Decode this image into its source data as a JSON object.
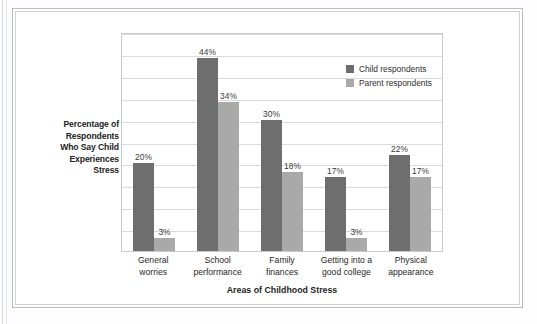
{
  "chart_data": {
    "type": "bar",
    "title": "",
    "xlabel": "Areas of Childhood Stress",
    "ylabel": "Percentage of Respondents Who Say Child Experiences Stress",
    "categories": [
      "General worries",
      "School performance",
      "Family finances",
      "Getting into a good college",
      "Physical appearance"
    ],
    "category_lines": [
      [
        "General",
        "worries"
      ],
      [
        "School",
        "performance"
      ],
      [
        "Family",
        "finances"
      ],
      [
        "Getting into a",
        "good college"
      ],
      [
        "Physical",
        "appearance"
      ]
    ],
    "series": [
      {
        "name": "Child respondents",
        "color": "#6e6e6e",
        "values": [
          20,
          44,
          30,
          17,
          22
        ],
        "labels": [
          "20%",
          "44%",
          "30%",
          "17%",
          "22%"
        ]
      },
      {
        "name": "Parent respondents",
        "color": "#a9a9a9",
        "values": [
          3,
          34,
          18,
          3,
          17
        ],
        "labels": [
          "3%",
          "34%",
          "18%",
          "3%",
          "17%"
        ]
      }
    ],
    "ylim": [
      0,
      50
    ],
    "y_tick_interval": 5,
    "y_tick_labels_shown": false,
    "gridlines": 10,
    "grid": true,
    "legend_position": "upper-right-inside"
  },
  "axis": {
    "y_title": "Percentage of Respondents Who Say Child Experiences Stress",
    "y_title_lines": [
      "Percentage of",
      "Respondents",
      "Who Say Child",
      "Experiences",
      "Stress"
    ],
    "x_title": "Areas of Childhood Stress"
  },
  "legend": {
    "items": [
      {
        "label": "Child respondents",
        "color": "#6e6e6e"
      },
      {
        "label": "Parent respondents",
        "color": "#a9a9a9"
      }
    ]
  },
  "colors": {
    "child_bar": "#6e6e6e",
    "parent_bar": "#a9a9a9",
    "gridline": "#d9dbde",
    "plot_border": "#c8cacd",
    "frame_outer": "#b9bcc0",
    "frame_inner": "#cfd2d6",
    "background": "#ffffff",
    "text": "#2b2b2b"
  }
}
